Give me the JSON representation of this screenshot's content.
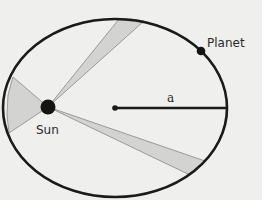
{
  "diagram": {
    "colors": {
      "background": "#efefed",
      "orbit": "#1a1a1a",
      "wedge_fill": "#d3d3d1",
      "wedge_stroke": "#9a9a98",
      "body": "#141414"
    },
    "labels": {
      "planet": "Planet",
      "sun": "Sun",
      "semi_major_axis": "a"
    },
    "orbit": {
      "cx": 115,
      "cy": 108,
      "rx": 112,
      "ry": 89
    },
    "sun": {
      "x": 48,
      "y": 107,
      "r": 7
    },
    "planet": {
      "x": 201,
      "y": 51,
      "r": 4
    },
    "center": {
      "x": 115,
      "y": 108,
      "r": 2.5
    },
    "wedges": [
      {
        "name": "left-sweep",
        "p1": [
          13,
          77
        ],
        "p2": [
          9,
          133
        ]
      },
      {
        "name": "top-sweep",
        "p1": [
          119,
          19
        ],
        "p2": [
          144,
          21
        ]
      },
      {
        "name": "bottom-right-sweep",
        "p1": [
          205,
          161
        ],
        "p2": [
          190,
          175
        ]
      }
    ]
  }
}
